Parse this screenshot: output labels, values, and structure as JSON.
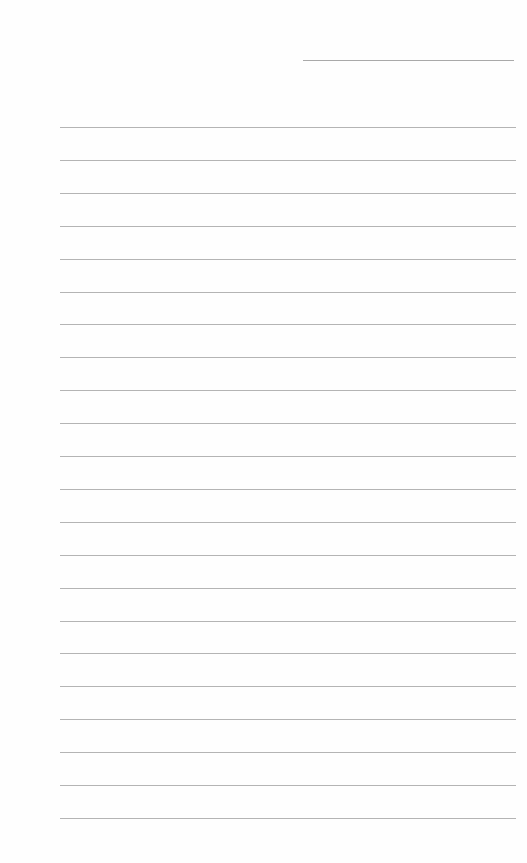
{
  "page": {
    "type": "blank-lined-sheet",
    "header_line": {
      "present": true,
      "label": ""
    },
    "rules": {
      "count": 22,
      "first_y": 127,
      "spacing": 32.9,
      "color": "#b4b4b4"
    },
    "background_color": "#fefefe"
  }
}
